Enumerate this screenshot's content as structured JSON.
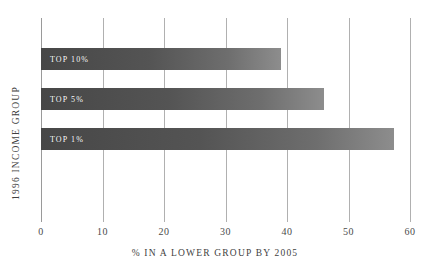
{
  "clipped_title": "(cut off)",
  "chart_data": {
    "type": "bar",
    "orientation": "horizontal",
    "title": "",
    "xlabel": "% IN A LOWER GROUP BY 2005",
    "ylabel": "1996 INCOME GROUP",
    "categories": [
      "TOP 10%",
      "TOP 5%",
      "TOP 1%"
    ],
    "values": [
      39,
      46,
      57.4
    ],
    "xlim": [
      0,
      60
    ],
    "xticks": [
      0,
      10,
      20,
      30,
      40,
      50,
      60
    ],
    "xtick_labels": [
      "0",
      "10",
      "20",
      "30",
      "40",
      "50",
      "60"
    ],
    "grid": true,
    "legend": false,
    "bar_gradient_start": "#474747",
    "bar_gradient_end": "#8d8d8d",
    "gridline_color": "#b0b0b0",
    "text_color": "#3f3f3f",
    "bar_label_color": "#ffffff",
    "background": "#ffffff"
  }
}
